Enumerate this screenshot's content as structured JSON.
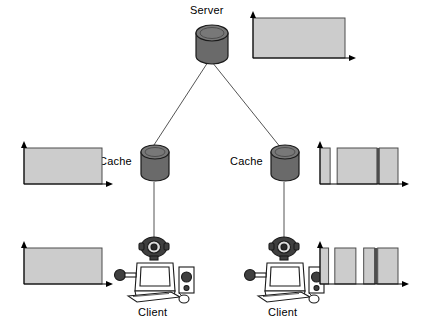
{
  "diagram": {
    "colors": {
      "cylinder_body": "#666666",
      "cylinder_top": "#777777",
      "cylinder_stroke": "#1a1a1a",
      "bar_fill": "#cccccc",
      "bar_stroke": "#4d4d4d",
      "axis": "#000000",
      "link": "#555555",
      "device_outline": "#1a1a1a",
      "device_dark": "#3a3a3a",
      "background": "#ffffff"
    },
    "nodes": [
      {
        "id": "server",
        "label": "Server",
        "type": "cylinder",
        "x": 197,
        "y": 28,
        "label_x": 190,
        "label_y": 4
      },
      {
        "id": "cache-left",
        "label": "Cache",
        "type": "cylinder",
        "x": 142,
        "y": 148,
        "label_x": 99,
        "label_y": 155
      },
      {
        "id": "cache-right",
        "label": "Cache",
        "type": "cylinder",
        "x": 272,
        "y": 148,
        "label_x": 230,
        "label_y": 155
      },
      {
        "id": "client-left",
        "label": "Client",
        "type": "workstation",
        "x": 118,
        "y": 236,
        "label_x": 138,
        "label_y": 306
      },
      {
        "id": "client-right",
        "label": "Client",
        "type": "workstation",
        "x": 248,
        "y": 236,
        "label_x": 268,
        "label_y": 306
      }
    ],
    "links": [
      {
        "from": "server",
        "to": "cache-left"
      },
      {
        "from": "server",
        "to": "cache-right"
      },
      {
        "from": "cache-left",
        "to": "client-left"
      },
      {
        "from": "cache-right",
        "to": "client-right"
      }
    ]
  },
  "chart_data": [
    {
      "id": "chart-server-out",
      "type": "bar",
      "title": "",
      "xlabel": "",
      "ylabel": "",
      "position": "top-right",
      "xlim": [
        0,
        100
      ],
      "ylim": [
        0,
        100
      ],
      "grid": false,
      "legend": null,
      "description": "Single continuous full-height block: one aggregated stream leaving the server.",
      "segments": [
        {
          "start": 0,
          "end": 100,
          "height": 100,
          "filled": true
        }
      ]
    },
    {
      "id": "chart-cache-left-out",
      "type": "bar",
      "title": "",
      "xlabel": "",
      "ylabel": "",
      "position": "middle-left",
      "xlim": [
        0,
        100
      ],
      "ylim": [
        0,
        100
      ],
      "grid": false,
      "legend": null,
      "description": "Single continuous full-height block at the left cache.",
      "segments": [
        {
          "start": 0,
          "end": 100,
          "height": 100,
          "filled": true
        }
      ]
    },
    {
      "id": "chart-cache-right-out",
      "type": "bar",
      "title": "",
      "xlabel": "",
      "ylabel": "",
      "position": "middle-right",
      "xlim": [
        0,
        100
      ],
      "ylim": [
        0,
        100
      ],
      "grid": false,
      "legend": null,
      "description": "Three blocks separated by one white gap and one dark divider.",
      "segments": [
        {
          "start": 0,
          "end": 13,
          "height": 100,
          "filled": true
        },
        {
          "start": 13,
          "end": 22,
          "height": 0,
          "filled": false
        },
        {
          "start": 22,
          "end": 73,
          "height": 100,
          "filled": true
        },
        {
          "start": 73,
          "end": 76,
          "height": 100,
          "filled": true,
          "divider": true
        },
        {
          "start": 76,
          "end": 100,
          "height": 100,
          "filled": true
        }
      ]
    },
    {
      "id": "chart-client-left-in",
      "type": "bar",
      "title": "",
      "xlabel": "",
      "ylabel": "",
      "position": "bottom-left",
      "xlim": [
        0,
        100
      ],
      "ylim": [
        0,
        100
      ],
      "grid": false,
      "legend": null,
      "description": "Single continuous full-height block received by the left client.",
      "segments": [
        {
          "start": 0,
          "end": 100,
          "height": 100,
          "filled": true
        }
      ]
    },
    {
      "id": "chart-client-right-in",
      "type": "bar",
      "title": "",
      "xlabel": "",
      "ylabel": "",
      "position": "bottom-right",
      "xlim": [
        0,
        100
      ],
      "ylim": [
        0,
        100
      ],
      "grid": false,
      "legend": null,
      "description": "Five blocks separated by two white gaps and a dark divider: fragmented delivery.",
      "segments": [
        {
          "start": 0,
          "end": 11,
          "height": 100,
          "filled": true
        },
        {
          "start": 11,
          "end": 19,
          "height": 0,
          "filled": false
        },
        {
          "start": 19,
          "end": 46,
          "height": 100,
          "filled": true
        },
        {
          "start": 46,
          "end": 56,
          "height": 0,
          "filled": false
        },
        {
          "start": 56,
          "end": 70,
          "height": 100,
          "filled": true
        },
        {
          "start": 70,
          "end": 74,
          "height": 100,
          "filled": true,
          "divider": true
        },
        {
          "start": 74,
          "end": 100,
          "height": 100,
          "filled": true
        }
      ]
    }
  ]
}
